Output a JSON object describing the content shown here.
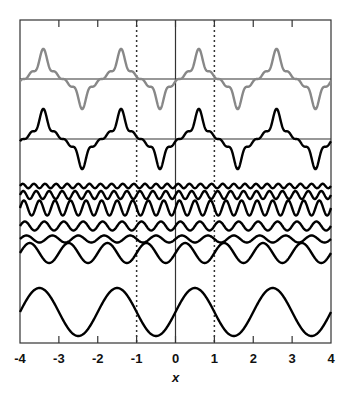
{
  "chart_data": {
    "type": "line",
    "title": "",
    "xlabel": "x",
    "ylabel": "",
    "xlim": [
      -4,
      4
    ],
    "x_ticks": [
      -4,
      -3,
      -2,
      -1,
      0,
      1,
      2,
      3,
      4
    ],
    "x_tick_labels": [
      "-4",
      "-3",
      "-2",
      "-1",
      "0",
      "1",
      "2",
      "3",
      "4"
    ],
    "grid": false,
    "legend": null,
    "vertical_reference_lines": [
      {
        "x": -1,
        "style": "dotted"
      },
      {
        "x": 0,
        "style": "solid"
      },
      {
        "x": 1,
        "style": "dotted"
      }
    ],
    "panels": [
      {
        "name": "sum-gray",
        "description": "Fourier partial sum (gray), period 2",
        "color": "#888888",
        "baseline_px": 79,
        "scale_px": 40
      },
      {
        "name": "sum-black",
        "description": "Fourier partial sum (black), period 2",
        "color": "#000000",
        "baseline_px": 139,
        "scale_px": 40
      }
    ],
    "series": [
      {
        "name": "harmonic-7",
        "harmonic": 7,
        "amplitude": 0.08,
        "phase": 0.0,
        "center_px": 186,
        "amp_px": 2.2
      },
      {
        "name": "harmonic-6",
        "harmonic": 6,
        "amplitude": 0.14,
        "phase": 0.0,
        "center_px": 195,
        "amp_px": 4
      },
      {
        "name": "harmonic-5",
        "harmonic": 5,
        "amplitude": 0.3,
        "phase": 0.0,
        "center_px": 208,
        "amp_px": 7.5
      },
      {
        "name": "harmonic-4",
        "harmonic": 4,
        "amplitude": 0.18,
        "phase": 0.0,
        "center_px": 226,
        "amp_px": 4.5
      },
      {
        "name": "harmonic-3",
        "harmonic": 3,
        "amplitude": 0.16,
        "phase": 0.0,
        "center_px": 239,
        "amp_px": 3.5
      },
      {
        "name": "harmonic-2",
        "harmonic": 2,
        "amplitude": 0.4,
        "phase": 0.0,
        "center_px": 253,
        "amp_px": 10
      },
      {
        "name": "harmonic-1",
        "harmonic": 1,
        "amplitude": 1.0,
        "phase": 0.0,
        "center_px": 312,
        "amp_px": 24
      }
    ]
  },
  "axis": {
    "xlabel": "x",
    "ticks": [
      "-4",
      "-3",
      "-2",
      "-1",
      "0",
      "1",
      "2",
      "3",
      "4"
    ]
  }
}
